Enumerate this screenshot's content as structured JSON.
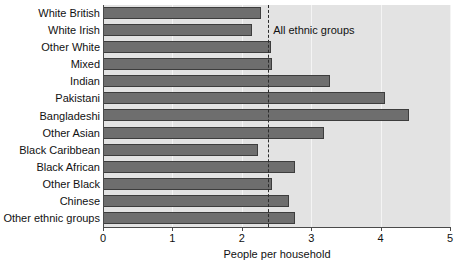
{
  "chart_data": {
    "type": "bar",
    "orientation": "horizontal",
    "title": "",
    "xlabel": "People per household",
    "ylabel": "",
    "xlim": [
      0,
      5
    ],
    "xticks": [
      0,
      1,
      2,
      3,
      4,
      5
    ],
    "xtick_labels": [
      "0",
      "1",
      "2",
      "3",
      "4",
      "5"
    ],
    "grid": true,
    "grid_axis": "x",
    "legend": false,
    "categories": [
      "White British",
      "White Irish",
      "Other White",
      "Mixed",
      "Indian",
      "Pakistani",
      "Bangladeshi",
      "Other Asian",
      "Black Caribbean",
      "Black African",
      "Other Black",
      "Chinese",
      "Other ethnic groups"
    ],
    "values": [
      2.28,
      2.15,
      2.42,
      2.44,
      3.27,
      4.06,
      4.41,
      3.18,
      2.23,
      2.77,
      2.44,
      2.68,
      2.77
    ],
    "annotations": [
      {
        "type": "reference-line",
        "label": "All ethnic groups",
        "value": 2.38,
        "style": "dashed"
      }
    ],
    "colors": {
      "bar_fill": "#6e6e6e",
      "bar_border": "#3d3d3d",
      "plot_background": "#e3e3e3",
      "gridline": "#f4f4f4",
      "axis": "#4a4a4a",
      "text": "#111111"
    }
  }
}
